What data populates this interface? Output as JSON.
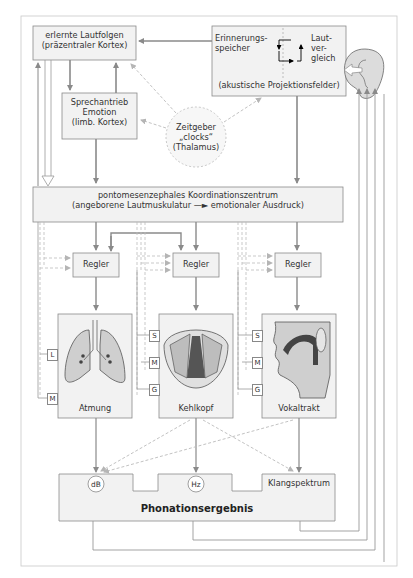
{
  "diagram": {
    "colors": {
      "box_fill": "#f2f2f2",
      "box_stroke": "#8a8a8a",
      "arrow": "#8a8a8a",
      "dashed_arrow": "#bbbbbb",
      "organ_fill": "#cfcfcf",
      "organ_dark": "#555555"
    },
    "boxes": {
      "lautfolgen": {
        "line1": "erlernte Lautfolgen",
        "line2": "(präzentraler Kortex)"
      },
      "sprechantrieb": {
        "line1": "Sprechantrieb",
        "line2": "Emotion",
        "line3": "(limb. Kortex)"
      },
      "erinnerung": {
        "left1": "Erinnerungs-",
        "left2": "speicher",
        "right1": "Laut-",
        "right2": "ver-",
        "right3": "gleich",
        "bottom": "(akustische Projektionsfelder)"
      },
      "zeitgeber": {
        "line1": "Zeitgeber",
        "line2": "„clocks“",
        "line3": "(Thalamus)"
      },
      "koordination": {
        "line1": "pontomesenzephales Koordinationszentrum",
        "line2_left": "(angeborene Lautmuskulatur",
        "line2_right": "emotionaler Ausdruck)"
      },
      "regler": [
        "Regler",
        "Regler",
        "Regler"
      ],
      "organs": [
        {
          "label": "Atmung",
          "icon": "lungs-icon",
          "tags": [
            "L",
            "M"
          ]
        },
        {
          "label": "Kehlkopf",
          "icon": "larynx-icon",
          "tags": [
            "S",
            "M",
            "G"
          ]
        },
        {
          "label": "Vokaltrakt",
          "icon": "vocal-tract-icon",
          "tags": [
            "S",
            "M",
            "G"
          ]
        }
      ],
      "ergebnis": {
        "title": "Phonationsergebnis",
        "db": "dB",
        "hz": "Hz",
        "klang": "Klangspektrum"
      }
    },
    "icons": {
      "ear": "ear-icon"
    }
  }
}
